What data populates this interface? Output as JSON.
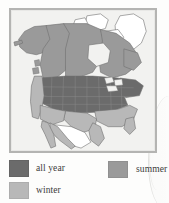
{
  "figure": {
    "kind": "range-map",
    "region": "North America",
    "frame_color": "#b4b4b2",
    "panel_background": "#f2f2f0"
  },
  "map": {
    "name": "north-america-range-map",
    "ocean_color": "#f2f2f0",
    "outline_color": "#6e6e6e",
    "state_border_color": "#7a7a7a",
    "regions": [
      {
        "name": "alaska",
        "category": "summer",
        "color": "#9a9a9a"
      },
      {
        "name": "canada-west",
        "category": "summer",
        "color": "#9a9a9a"
      },
      {
        "name": "canada-central",
        "category": "summer",
        "color": "#9a9a9a"
      },
      {
        "name": "canada-east",
        "category": "summer",
        "color": "#9a9a9a"
      },
      {
        "name": "arctic-islands",
        "category": "none",
        "color": "#ffffff"
      },
      {
        "name": "greenland",
        "category": "none",
        "color": "#ffffff"
      },
      {
        "name": "usa-northern-tier",
        "category": "all year",
        "color": "#6b6b6b"
      },
      {
        "name": "usa-great-plains",
        "category": "all year",
        "color": "#6b6b6b"
      },
      {
        "name": "usa-midwest",
        "category": "all year",
        "color": "#6b6b6b"
      },
      {
        "name": "usa-northeast",
        "category": "all year",
        "color": "#6b6b6b"
      },
      {
        "name": "usa-pacific-coast",
        "category": "winter",
        "color": "#b8b8b8"
      },
      {
        "name": "usa-southeast",
        "category": "winter",
        "color": "#b8b8b8"
      },
      {
        "name": "usa-south-texas",
        "category": "winter",
        "color": "#b8b8b8"
      },
      {
        "name": "mexico-coastal",
        "category": "winter",
        "color": "#b8b8b8"
      },
      {
        "name": "mexico-interior",
        "category": "none",
        "color": "#ffffff"
      },
      {
        "name": "baja-california",
        "category": "winter",
        "color": "#b8b8b8"
      }
    ]
  },
  "legend": {
    "name": "range-legend",
    "items": [
      {
        "label": "all year",
        "color": "#6b6b6b"
      },
      {
        "label": "summer",
        "color": "#9a9a9a"
      },
      {
        "label": "winter",
        "color": "#b8b8b8"
      }
    ]
  }
}
